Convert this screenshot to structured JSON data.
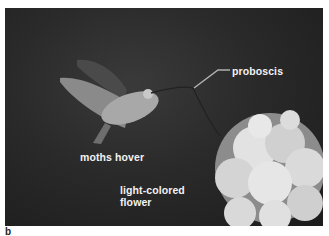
{
  "figure": {
    "panel_letter": "b",
    "labels": {
      "proboscis": "proboscis",
      "moths_hover": "moths hover",
      "flower": "light-colored flower"
    }
  }
}
